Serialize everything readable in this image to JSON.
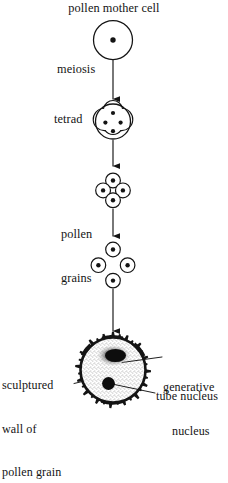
{
  "diagram": {
    "background_color": "#ffffff",
    "ink_color": "#141414",
    "labels": {
      "pollen_mother_cell": "pollen mother cell",
      "meiosis": "meiosis",
      "tetrad": "tetrad",
      "pollen_grains_line1": "pollen",
      "pollen_grains_line2": "grains",
      "sculptured_wall_line1": "sculptured",
      "sculptured_wall_line2": "wall of",
      "sculptured_wall_line3": "pollen grain",
      "generative_nucleus_line1": "generative",
      "generative_nucleus_line2": "nucleus",
      "tube_nucleus": "tube nucleus"
    },
    "stages": [
      {
        "name": "pollen-mother-cell",
        "shape": "single-circle-with-nucleus",
        "cell_count": 1,
        "nucleus_count": 1
      },
      {
        "name": "tetrad",
        "shape": "circle-divided-into-four-compartments",
        "cell_count": 4,
        "nucleus_count": 4
      },
      {
        "name": "separating-tetrad",
        "shape": "four-touching-circles-diamond",
        "cell_count": 4,
        "nucleus_count": 4
      },
      {
        "name": "pollen-grains",
        "shape": "four-separate-circles-diamond",
        "cell_count": 4,
        "nucleus_count": 4
      },
      {
        "name": "mature-pollen-grain",
        "shape": "stippled-circle-with-spiky-sculptured-wall",
        "cell_count": 1,
        "nucleus_count": 2,
        "nuclei": [
          "generative nucleus",
          "tube nucleus"
        ]
      }
    ],
    "arrows": [
      {
        "name": "arrow-meiosis",
        "from": "pollen-mother-cell",
        "to": "tetrad"
      },
      {
        "name": "arrow-tetrad-to-cluster",
        "from": "tetrad",
        "to": "separating-tetrad"
      },
      {
        "name": "arrow-cluster-to-grains",
        "from": "separating-tetrad",
        "to": "pollen-grains"
      },
      {
        "name": "arrow-grains-to-mature",
        "from": "pollen-grains",
        "to": "mature-pollen-grain"
      }
    ]
  }
}
